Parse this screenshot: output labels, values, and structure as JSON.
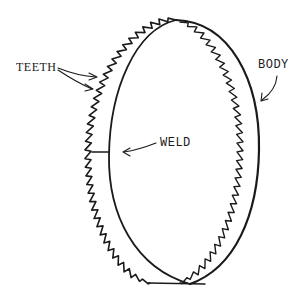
{
  "diagram": {
    "colors": {
      "ink": "#1a1a1a",
      "background": "#ffffff"
    },
    "labels": {
      "teeth": "TEETH",
      "body": "BODY",
      "weld": "WELD"
    }
  }
}
